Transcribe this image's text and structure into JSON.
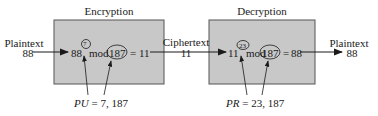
{
  "encryption": {
    "title": "Encryption",
    "base": "88",
    "exponent": "7",
    "mod_label": "mod",
    "modulus": "187",
    "equals": "=",
    "result": "11",
    "key_label": "PU",
    "key_eq": "=",
    "key_value": "7, 187"
  },
  "decryption": {
    "title": "Decryption",
    "base": "11",
    "exponent": "23",
    "mod_label": "mod",
    "modulus": "187",
    "equals": "=",
    "result": "88",
    "key_label": "PR",
    "key_eq": "=",
    "key_value": "23, 187"
  },
  "input": {
    "label": "Plaintext",
    "value": "88"
  },
  "middle": {
    "label": "Ciphertext",
    "value": "11"
  },
  "output": {
    "label": "Plaintext",
    "value": "88"
  },
  "colors": {
    "box_fill": "#c8c8c8",
    "box_stroke": "#555555",
    "line": "#1a1a1a"
  }
}
